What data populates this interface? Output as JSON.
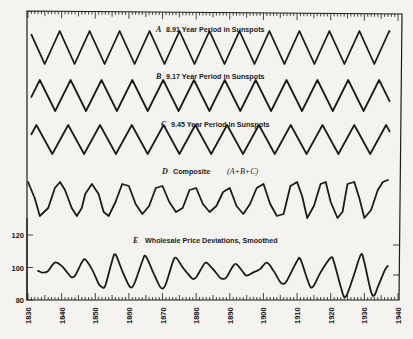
{
  "chart_data": {
    "type": "line",
    "title": "",
    "xlabel": "",
    "ylabel": "",
    "x_axis": {
      "range": [
        1830,
        1940
      ],
      "tick_labels": [
        "1830",
        "1840",
        "1850",
        "1860",
        "1870",
        "1880",
        "1890",
        "1900",
        "1910",
        "1920",
        "1930",
        "1940"
      ],
      "minor_tick_step_years": 1
    },
    "y_axis_E": {
      "range": [
        80,
        120
      ],
      "tick_labels": [
        "80",
        "100",
        "120"
      ]
    },
    "grid": false,
    "legend": null,
    "panels": [
      {
        "id": "A",
        "letter": "A",
        "label": "8.91 Year Period in Sunspots",
        "shape": "triangle-wave",
        "period_years": 8.91,
        "first_peak_year": 1830.5
      },
      {
        "id": "B",
        "letter": "B",
        "label": "9.17 Year Period in Sunspots",
        "shape": "triangle-wave",
        "period_years": 9.17,
        "first_peak_year": 1833.5
      },
      {
        "id": "C",
        "letter": "C",
        "label": "9.45 Year Period in Sunspots",
        "shape": "triangle-wave",
        "period_years": 9.45,
        "first_peak_year": 1832.5
      },
      {
        "id": "D",
        "letter": "D",
        "label": "Composite",
        "formula": "(A+B+C)",
        "shape": "composite",
        "x": [
          1830,
          1832,
          1833.5,
          1836,
          1838,
          1839.5,
          1841,
          1843,
          1844.5,
          1846,
          1847,
          1849,
          1851,
          1852.5,
          1854,
          1856,
          1858,
          1860,
          1862,
          1864,
          1866,
          1868,
          1870,
          1872,
          1874,
          1876,
          1878,
          1880,
          1882,
          1884,
          1886,
          1888,
          1890,
          1892,
          1894,
          1896,
          1898,
          1900,
          1902,
          1904,
          1906,
          1908,
          1910,
          1911.5,
          1913,
          1915,
          1917,
          1918.5,
          1920,
          1922,
          1923.5,
          1925,
          1927,
          1928.5,
          1930,
          1932,
          1934,
          1935.5,
          1937
        ],
        "values": [
          0.9,
          0.1,
          -0.8,
          -0.4,
          0.6,
          0.9,
          0.5,
          -0.4,
          -0.8,
          -0.4,
          0.3,
          0.8,
          0.3,
          -0.6,
          -0.8,
          -0.1,
          0.8,
          0.7,
          -0.2,
          -0.7,
          -0.3,
          0.6,
          0.7,
          -0.1,
          -0.6,
          -0.4,
          0.5,
          0.6,
          -0.2,
          -0.6,
          -0.3,
          0.4,
          0.6,
          -0.3,
          -0.7,
          -0.2,
          0.6,
          0.8,
          -0.2,
          -0.8,
          -0.7,
          0.7,
          0.9,
          0.2,
          -0.9,
          -0.3,
          0.8,
          0.9,
          -0.1,
          -0.9,
          -0.6,
          0.8,
          0.9,
          0.1,
          -0.9,
          -0.5,
          0.5,
          0.9,
          1.0
        ]
      },
      {
        "id": "E",
        "letter": "E",
        "label": "Wholesale Price Deviations, Smoothed",
        "shape": "measured",
        "x": [
          1833,
          1834,
          1835,
          1836,
          1838,
          1840,
          1842,
          1843,
          1844,
          1846,
          1847,
          1849,
          1851,
          1852,
          1853,
          1855,
          1856,
          1858,
          1860,
          1861,
          1862,
          1864,
          1865,
          1867,
          1869,
          1870,
          1871,
          1873,
          1874,
          1876,
          1878,
          1879,
          1880,
          1882,
          1883,
          1885,
          1887,
          1888,
          1889,
          1891,
          1892,
          1894,
          1895,
          1897,
          1899,
          1901,
          1903,
          1905,
          1906,
          1907,
          1910,
          1911,
          1913,
          1914,
          1915,
          1917,
          1920,
          1921,
          1923,
          1924,
          1925,
          1927,
          1929,
          1930,
          1932,
          1933,
          1934,
          1936,
          1937
        ],
        "values": [
          98,
          97,
          97,
          98,
          103,
          101,
          96,
          94,
          95,
          103,
          105,
          99,
          90,
          88,
          89,
          104,
          108,
          98,
          89,
          88,
          92,
          104,
          107,
          98,
          89,
          87,
          90,
          103,
          106,
          100,
          95,
          93,
          94,
          101,
          103,
          99,
          94,
          93,
          94,
          101,
          102,
          97,
          95,
          97,
          99,
          103,
          98,
          91,
          90,
          92,
          104,
          105,
          93,
          88,
          89,
          97,
          106,
          103,
          88,
          82,
          84,
          96,
          108,
          103,
          85,
          83,
          88,
          98,
          101
        ]
      }
    ]
  },
  "labels": {
    "A_letter": "A",
    "A_text": "8.91 Year Period in Sunspots",
    "B_letter": "B",
    "B_text": "9.17 Year Period in Sunspots",
    "C_letter": "C",
    "C_text": "9.45 Year Period in Sunspots",
    "D_letter": "D",
    "D_text": "Composite",
    "D_formula": "(A+B+C)",
    "E_letter": "E",
    "E_text": "Wholesale Price Deviations, Smoothed"
  }
}
